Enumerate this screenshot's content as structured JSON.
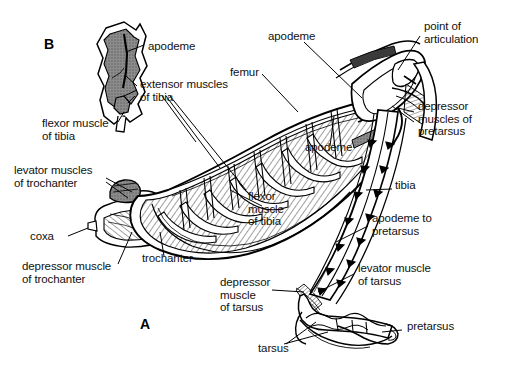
{
  "figure": {
    "kind": "anatomical-diagram",
    "width": 506,
    "height": 376,
    "background_color": "#ffffff",
    "line_color": "#000000",
    "muscle_fill_color": "#8c8c8c",
    "panels": [
      {
        "id": "A",
        "label": "A",
        "x": 140,
        "y": 318
      },
      {
        "id": "B",
        "label": "B",
        "x": 44,
        "y": 44
      }
    ]
  },
  "labels": [
    {
      "id": "apodeme-b",
      "text": "apodeme",
      "x": 148,
      "y": 48,
      "align": "left"
    },
    {
      "id": "extensor-muscles",
      "text": "extensor muscles\nof tibia",
      "x": 140,
      "y": 84,
      "align": "left"
    },
    {
      "id": "flexor-muscle-b",
      "text": "flexor muscle\nof tibia",
      "x": 42,
      "y": 123,
      "align": "left"
    },
    {
      "id": "levator-trochanter",
      "text": "levator muscles\nof trochanter",
      "x": 14,
      "y": 170,
      "align": "left"
    },
    {
      "id": "coxa",
      "text": "coxa",
      "x": 30,
      "y": 236,
      "align": "left"
    },
    {
      "id": "depressor-trochanter",
      "text": "depressor muscle\nof trochanter",
      "x": 22,
      "y": 266,
      "align": "left"
    },
    {
      "id": "trochanter",
      "text": "trochanter",
      "x": 142,
      "y": 258,
      "align": "left"
    },
    {
      "id": "femur",
      "text": "femur",
      "x": 230,
      "y": 72,
      "align": "left"
    },
    {
      "id": "apodeme-top",
      "text": "apodeme",
      "x": 268,
      "y": 36,
      "align": "left"
    },
    {
      "id": "apodeme-mid",
      "text": "apodeme",
      "x": 305,
      "y": 147,
      "align": "left"
    },
    {
      "id": "point-of-articulation",
      "text": "point of\narticulation",
      "x": 424,
      "y": 26,
      "align": "left"
    },
    {
      "id": "depressor-pretarsus",
      "text": "depressor\nmuscles of\npretarsus",
      "x": 418,
      "y": 106,
      "align": "left"
    },
    {
      "id": "tibia",
      "text": "tibia",
      "x": 395,
      "y": 185,
      "align": "left"
    },
    {
      "id": "apodeme-to-pretarsus",
      "text": "apodeme to\npretarsus",
      "x": 372,
      "y": 218,
      "align": "left"
    },
    {
      "id": "levator-tarsus",
      "text": "levator muscle\nof tarsus",
      "x": 358,
      "y": 268,
      "align": "left"
    },
    {
      "id": "flexor-muscle-tibia",
      "text": "flexor\nmuscle\nof tibia",
      "x": 248,
      "y": 196,
      "align": "left"
    },
    {
      "id": "depressor-tarsus",
      "text": "depressor\nmuscle\nof tarsus",
      "x": 220,
      "y": 282,
      "align": "left"
    },
    {
      "id": "pretarsus",
      "text": "pretarsus",
      "x": 407,
      "y": 326,
      "align": "left"
    },
    {
      "id": "tarsus",
      "text": "tarsus",
      "x": 258,
      "y": 348,
      "align": "left"
    }
  ]
}
